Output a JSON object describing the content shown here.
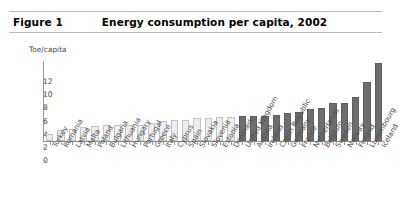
{
  "header": {
    "figure_label": "Figure 1",
    "title": "Energy consumption per capita, 2002"
  },
  "chart_data": {
    "type": "bar",
    "title": "Energy consumption per capita, 2002",
    "subtitle": "",
    "xlabel": "",
    "ylabel": "Toe/capita",
    "y_unit_label": "Toe/capita",
    "ylim": [
      0,
      12
    ],
    "yticks": [
      0,
      2,
      4,
      6,
      8,
      10,
      12
    ],
    "ytick_labels": [
      "0",
      "2",
      "4",
      "6",
      "8",
      "10",
      "12"
    ],
    "grid": false,
    "legend": "none",
    "legend_position": "none",
    "series_colors": {
      "light_bar_fill": "#ededed",
      "light_bar_border": "#c3c3c3",
      "dark_bar_fill": "#6e6e6e",
      "dark_bar_border": "#5f5f5f"
    },
    "categories": [
      "Turkey",
      "Romania",
      "Latvia",
      "Malta",
      "Poland",
      "Bulgaria",
      "Lithuania",
      "Hungary",
      "Portugal",
      "Greece",
      "Italy",
      "Cyprus",
      "Spain",
      "Slovakia",
      "Slovenia",
      "Estonia",
      "Denmark",
      "United Kingdom",
      "Austria",
      "Ireland",
      "Czech Republic",
      "Germany",
      "France",
      "Netherlands",
      "Belgium",
      "Sweden",
      "Norway",
      "Finland",
      "Luxembourg",
      "Iceland"
    ],
    "values": [
      1.0,
      1.6,
      1.8,
      2.1,
      2.3,
      2.4,
      2.5,
      2.5,
      2.5,
      2.8,
      3.1,
      3.2,
      3.2,
      3.5,
      3.5,
      3.7,
      3.7,
      3.8,
      3.8,
      3.8,
      4.0,
      4.2,
      4.4,
      4.8,
      5.0,
      5.7,
      5.8,
      6.7,
      8.9,
      11.8
    ],
    "groups": [
      {
        "name": "light",
        "categories": [
          "Turkey",
          "Romania",
          "Latvia",
          "Malta",
          "Poland",
          "Bulgaria",
          "Lithuania",
          "Hungary",
          "Portugal",
          "Greece",
          "Italy",
          "Cyprus",
          "Spain",
          "Slovakia",
          "Slovenia",
          "Estonia",
          "Denmark"
        ]
      },
      {
        "name": "dark",
        "categories": [
          "United Kingdom",
          "Austria",
          "Ireland",
          "Czech Republic",
          "Germany",
          "France",
          "Netherlands",
          "Belgium",
          "Sweden",
          "Norway",
          "Finland",
          "Luxembourg",
          "Iceland"
        ]
      }
    ],
    "bar_styles": [
      "light",
      "light",
      "light",
      "light",
      "light",
      "light",
      "light",
      "light",
      "light",
      "light",
      "light",
      "light",
      "light",
      "light",
      "light",
      "light",
      "light",
      "dark",
      "dark",
      "dark",
      "dark",
      "dark",
      "dark",
      "dark",
      "dark",
      "dark",
      "dark",
      "dark",
      "dark",
      "dark"
    ]
  }
}
